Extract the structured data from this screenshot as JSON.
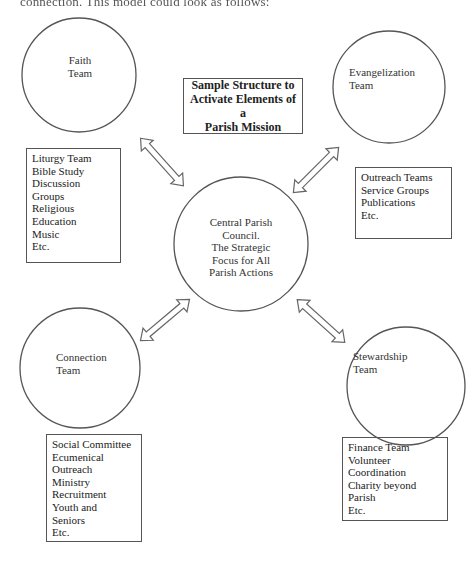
{
  "page": {
    "top_text": "connection. This model could look as follows:"
  },
  "title_box": {
    "lines": [
      "Sample Structure to",
      "Activate Elements of a",
      "Parish Mission"
    ]
  },
  "center": {
    "lines": [
      "Central Parish",
      "Council.",
      "The Strategic",
      "Focus for All",
      "Parish Actions"
    ]
  },
  "teams": {
    "faith": {
      "name_lines": [
        "Faith",
        "Team"
      ],
      "items": [
        "Liturgy Team",
        "Bible Study",
        "Discussion",
        "Groups",
        "Religious",
        "Education",
        "Music",
        "Etc."
      ]
    },
    "evangelization": {
      "name_lines": [
        "Evangelization",
        "Team"
      ],
      "items": [
        "Outreach Teams",
        "Service Groups",
        "Publications",
        "Etc."
      ]
    },
    "connection": {
      "name_lines": [
        "Connection",
        "Team"
      ],
      "items": [
        "Social Committee",
        "Ecumenical",
        "Outreach",
        "Ministry",
        "Recruitment",
        "Youth and",
        "Seniors",
        "Etc."
      ]
    },
    "stewardship": {
      "name_lines": [
        "Stewardship",
        "Team"
      ],
      "items": [
        "Finance Team",
        "Volunteer",
        "Coordination",
        "Charity beyond",
        "Parish",
        "Etc."
      ]
    }
  },
  "connectors": [
    {
      "from": "faith",
      "to": "center",
      "type": "double-arrow"
    },
    {
      "from": "evangelization",
      "to": "center",
      "type": "double-arrow"
    },
    {
      "from": "connection",
      "to": "center",
      "type": "double-arrow"
    },
    {
      "from": "stewardship",
      "to": "center",
      "type": "double-arrow"
    }
  ],
  "colors": {
    "stroke": "#555555",
    "text": "#222222",
    "background": "#ffffff"
  }
}
